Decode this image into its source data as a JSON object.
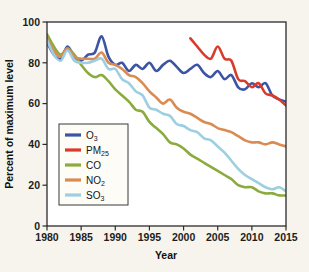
{
  "figure": {
    "background_color": "#f6f4ec",
    "plot_background_color": "#ffffff",
    "frame_color": "#2b2b2b"
  },
  "axes": {
    "x_title": "Year",
    "y_title": "Percent of maximum level",
    "x_ticks": [
      "1980",
      "1985",
      "1990",
      "1995",
      "2000",
      "2005",
      "2010",
      "2015"
    ],
    "y_ticks": [
      "0",
      "20",
      "40",
      "60",
      "80",
      "100"
    ]
  },
  "legend": {
    "position": "center-left-inside",
    "entries": [
      {
        "label": "O",
        "sub": "3",
        "color": "#3c54a4"
      },
      {
        "label": "PM",
        "sub": "25",
        "color": "#d93a2b"
      },
      {
        "label": "CO",
        "sub": "",
        "color": "#8cab3e"
      },
      {
        "label": "NO",
        "sub": "2",
        "color": "#da8b52"
      },
      {
        "label": "SO",
        "sub": "3",
        "color": "#9dcfe2"
      }
    ]
  },
  "chart_data": {
    "type": "line",
    "title": "",
    "xlabel": "Year",
    "ylabel": "Percent of maximum level",
    "xlim": [
      1980,
      2015
    ],
    "ylim": [
      0,
      100
    ],
    "grid": false,
    "legend_position": "center-left-inside",
    "x": [
      1980,
      1981,
      1982,
      1983,
      1984,
      1985,
      1986,
      1987,
      1988,
      1989,
      1990,
      1991,
      1992,
      1993,
      1994,
      1995,
      1996,
      1997,
      1998,
      1999,
      2000,
      2001,
      2002,
      2003,
      2004,
      2005,
      2006,
      2007,
      2008,
      2009,
      2010,
      2011,
      2012,
      2013,
      2014,
      2015
    ],
    "series": [
      {
        "name": "O3",
        "display": "O₃",
        "color": "#3c54a4",
        "values": [
          90,
          84,
          82,
          88,
          83,
          81,
          84,
          85,
          93,
          83,
          79,
          80,
          76,
          79,
          77,
          80,
          76,
          79,
          81,
          78,
          75,
          77,
          79,
          75,
          73,
          76,
          72,
          74,
          68,
          67,
          70,
          68,
          70,
          64,
          62,
          61
        ]
      },
      {
        "name": "PM25",
        "display": "PM₂₅",
        "color": "#d93a2b",
        "values": [
          null,
          null,
          null,
          null,
          null,
          null,
          null,
          null,
          null,
          null,
          null,
          null,
          null,
          null,
          null,
          null,
          null,
          null,
          null,
          null,
          null,
          92,
          88,
          84,
          82,
          88,
          82,
          81,
          72,
          71,
          68,
          70,
          65,
          64,
          62,
          59
        ]
      },
      {
        "name": "CO",
        "display": "CO",
        "color": "#8cab3e",
        "values": [
          94,
          88,
          84,
          87,
          84,
          79,
          75,
          73,
          74,
          71,
          67,
          64,
          61,
          57,
          56,
          51,
          48,
          45,
          41,
          40,
          38,
          35,
          33,
          31,
          29,
          27,
          25,
          23,
          20,
          19,
          19,
          17,
          16,
          16,
          15,
          15
        ]
      },
      {
        "name": "NO2",
        "display": "NO₂",
        "color": "#da8b52",
        "values": [
          92,
          86,
          83,
          87,
          83,
          82,
          82,
          82,
          85,
          80,
          79,
          77,
          74,
          73,
          70,
          66,
          63,
          60,
          62,
          58,
          56,
          55,
          53,
          51,
          50,
          48,
          47,
          46,
          44,
          42,
          41,
          41,
          40,
          41,
          40,
          39
        ]
      },
      {
        "name": "SO3",
        "display": "SO₃",
        "color": "#9dcfe2",
        "values": [
          91,
          84,
          81,
          86,
          81,
          80,
          80,
          81,
          82,
          77,
          77,
          72,
          70,
          66,
          64,
          58,
          57,
          55,
          54,
          50,
          49,
          47,
          46,
          43,
          42,
          39,
          36,
          32,
          28,
          25,
          23,
          21,
          19,
          18,
          19,
          17
        ]
      }
    ]
  }
}
